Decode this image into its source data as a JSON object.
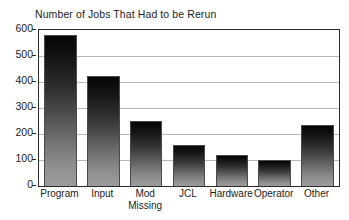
{
  "chart_data": {
    "type": "bar",
    "title": "Number of Jobs That Had to be Rerun",
    "xlabel": "",
    "ylabel": "",
    "categories": [
      "Program",
      "Input",
      "Mod\nMissing",
      "JCL",
      "Hardware",
      "Operator",
      "Other"
    ],
    "values": [
      580,
      425,
      250,
      158,
      118,
      100,
      233
    ],
    "ylim": [
      0,
      600
    ],
    "ytick_labels": [
      "0",
      "100",
      "200",
      "300",
      "400",
      "500",
      "600"
    ],
    "ytick_values": [
      0,
      100,
      200,
      300,
      400,
      500,
      600
    ],
    "grid": "horizontal",
    "legend": "none",
    "bar_style": {
      "fill": "vertical gradient black to gray",
      "top_color": "#050505",
      "bottom_color": "#9c9c9c",
      "border_color": "#4a4a4a"
    },
    "axis_color": "#2a2a2a",
    "gridline_color": "#b9b9b9",
    "background": "#ffffff"
  }
}
